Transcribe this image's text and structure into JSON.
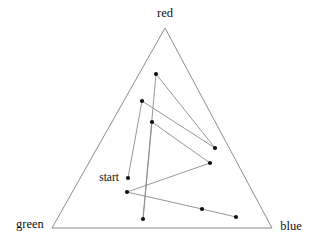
{
  "figure": {
    "title": "",
    "background_color": "#ffffff",
    "width": 316,
    "height": 241
  },
  "labels": {
    "red": "red",
    "green": "green",
    "blue": "blue",
    "start": "start"
  },
  "colors": {
    "triangle_stroke": "#808080",
    "path_stroke": "#8a8a8a",
    "marker_fill": "#101010",
    "text": "#111111"
  },
  "chart_data": {
    "type": "scatter",
    "title": "",
    "xlabel": "",
    "ylabel": "",
    "subtitle": "",
    "grid": false,
    "legend_position": "none",
    "coordinate_system": "ternary",
    "axes": [
      "red",
      "green",
      "blue"
    ],
    "vertices": {
      "red": {
        "px": [
          165,
          28
        ]
      },
      "green": {
        "px": [
          52,
          228
        ]
      },
      "blue": {
        "px": [
          272,
          228
        ]
      }
    },
    "annotations": [
      {
        "text": "red",
        "px": [
          165,
          17
        ],
        "anchor": "middle"
      },
      {
        "text": "green",
        "px": [
          30,
          228
        ],
        "anchor": "middle"
      },
      {
        "text": "blue",
        "px": [
          291,
          230
        ],
        "anchor": "middle"
      },
      {
        "text": "start",
        "px": [
          119,
          181
        ],
        "anchor": "end"
      }
    ],
    "series": [
      {
        "name": "trajectory",
        "connected": true,
        "marker": "filled-circle",
        "points": [
          {
            "index": 0,
            "label": "start",
            "px": [
              128,
              178
            ],
            "ternary": [
              0.25,
              0.47,
              0.28
            ]
          },
          {
            "index": 1,
            "label": "",
            "px": [
              142,
              101
            ],
            "ternary": [
              0.63,
              0.26,
              0.11
            ]
          },
          {
            "index": 2,
            "label": "",
            "px": [
              215,
              148
            ],
            "ternary": [
              0.4,
              0.06,
              0.54
            ]
          },
          {
            "index": 3,
            "label": "",
            "px": [
              156,
              74
            ],
            "ternary": [
              0.77,
              0.15,
              0.08
            ]
          },
          {
            "index": 4,
            "label": "",
            "px": [
              143,
              219
            ],
            "ternary": [
              0.05,
              0.53,
              0.42
            ]
          },
          {
            "index": 5,
            "label": "",
            "px": [
              152,
              122
            ],
            "ternary": [
              0.53,
              0.28,
              0.19
            ]
          },
          {
            "index": 6,
            "label": "",
            "px": [
              210,
              163
            ],
            "ternary": [
              0.33,
              0.07,
              0.6
            ]
          },
          {
            "index": 7,
            "label": "",
            "px": [
              127,
              192
            ],
            "ternary": [
              0.18,
              0.51,
              0.31
            ]
          },
          {
            "index": 8,
            "label": "",
            "px": [
              202,
              209
            ],
            "ternary": [
              0.1,
              0.22,
              0.68
            ]
          },
          {
            "index": 9,
            "label": "",
            "px": [
              236,
              217
            ],
            "ternary": [
              0.06,
              0.1,
              0.84
            ]
          }
        ]
      }
    ]
  }
}
